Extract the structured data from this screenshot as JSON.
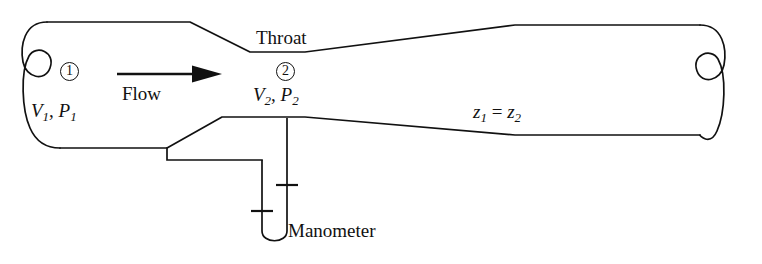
{
  "figure": {
    "line_color": "#111111",
    "background_color": "#ffffff"
  },
  "labels": {
    "throat": "Throat",
    "flow": "Flow",
    "station1_node": "1",
    "station2_node": "2",
    "manometer": "Manometer"
  },
  "variables": {
    "station1": {
      "velocity": "V",
      "velocity_sub": "1",
      "pressure": "P",
      "pressure_sub": "1",
      "separator": ", "
    },
    "station2": {
      "velocity": "V",
      "velocity_sub": "2",
      "pressure": "P",
      "pressure_sub": "2",
      "separator": ", "
    },
    "elevation": {
      "left": "z",
      "left_sub": "1",
      "relation": " = ",
      "right": "z",
      "right_sub": "2"
    }
  },
  "geometry": {
    "pipe_top_inlet_y": 22,
    "pipe_bottom_inlet_y": 148,
    "throat_top_y": 52,
    "throat_bottom_y": 117,
    "throat_x_start": 250,
    "throat_x_end": 305,
    "outlet_top_y": 25,
    "outlet_bottom_y": 135,
    "manometer_left_leg_x": 262,
    "manometer_right_leg_x": 287,
    "manometer_bottom_y": 243,
    "tap_drop_x": 167,
    "tap_run_y": 160
  }
}
